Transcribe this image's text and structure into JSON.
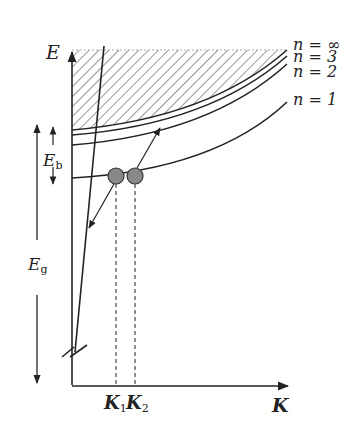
{
  "diagram": {
    "axes": {
      "y_label": "E",
      "x_label": "K"
    },
    "levels": [
      {
        "label": "n = ∞"
      },
      {
        "label": "n = 3"
      },
      {
        "label": "n = 2"
      },
      {
        "label": "n = 1"
      }
    ],
    "annotations": {
      "binding_energy": "E",
      "binding_energy_sub": "b",
      "gap_energy": "E",
      "gap_energy_sub": "g",
      "k1": "K",
      "k1_sub": "1",
      "k2": "K",
      "k2_sub": "2"
    },
    "colors": {
      "line": "#222222",
      "dot_fill": "#888888",
      "hatch": "#444444"
    }
  }
}
